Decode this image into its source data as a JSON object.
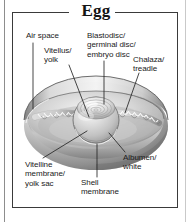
{
  "figure": {
    "title": "Egg"
  },
  "labels": {
    "air_space": "Air space",
    "vitellus_yolk": "Vitellus/\nyolk",
    "blastodisc": "Blastodisc/\ngerminal disc/\nembryo disc",
    "chalaza": "Chalaza/\ntreadle",
    "vitelline_membrane": "Vitelline\nmembrane/\nyolk sac",
    "shell_membrane": "Shell\nmembrane",
    "albumen_white": "Albumen/\nwhite"
  },
  "colors": {
    "title_text": "#141414",
    "label_text": "#1a1a1a",
    "border": "#3a3a3a",
    "leader_line": "#262626",
    "background": "#ffffff",
    "shell_light": "#f2f2f2",
    "shell_mid": "#b8b8b8",
    "shell_dark": "#6f6f6f",
    "albumen": "#d8d8d8",
    "yolk_light": "#efefef",
    "yolk_mid": "#c4c4c4",
    "chalaza": "#fafafa"
  }
}
